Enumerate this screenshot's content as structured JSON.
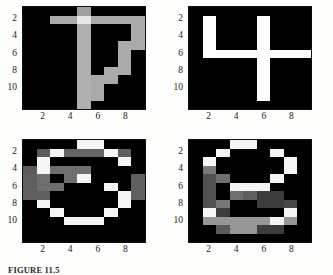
{
  "figure": {
    "caption": "FIGURE 11.5",
    "background_color": "#fdfdfb",
    "tick_color": "#1a1a1a",
    "panel_border_color": "#111111"
  },
  "axes": {
    "xticks": [
      "2",
      "4",
      "6",
      "8"
    ],
    "yticks": [
      "2",
      "4",
      "6",
      "8",
      "10"
    ],
    "xtick_values": [
      2,
      4,
      6,
      8
    ],
    "ytick_values": [
      2,
      4,
      6,
      8,
      10
    ]
  },
  "chart_data": {
    "type": "heatmap",
    "title": "FIGURE 11.5",
    "colormap": "gray",
    "vmin": 0,
    "vmax": 255,
    "grid": false,
    "legend": "none",
    "xlabel": "",
    "ylabel": "",
    "xlim": [
      0.5,
      9.5
    ],
    "ylim": [
      12.5,
      0.5
    ],
    "xticks": [
      2,
      4,
      6,
      8
    ],
    "yticks": [
      2,
      4,
      6,
      8,
      10
    ],
    "panel_cols": 9,
    "panel_rows": 12,
    "panels": [
      {
        "name": "digit-7",
        "position": "top-left",
        "label": "7",
        "values": [
          [
            0,
            0,
            0,
            0,
            160,
            0,
            0,
            0,
            0
          ],
          [
            0,
            0,
            170,
            170,
            230,
            170,
            170,
            170,
            170
          ],
          [
            0,
            0,
            0,
            0,
            175,
            0,
            0,
            0,
            170
          ],
          [
            0,
            0,
            0,
            0,
            175,
            0,
            0,
            0,
            170
          ],
          [
            0,
            0,
            0,
            0,
            175,
            0,
            0,
            170,
            170
          ],
          [
            0,
            0,
            0,
            0,
            175,
            0,
            0,
            170,
            0
          ],
          [
            0,
            0,
            0,
            0,
            175,
            0,
            0,
            170,
            0
          ],
          [
            0,
            0,
            0,
            0,
            175,
            0,
            170,
            170,
            0
          ],
          [
            0,
            0,
            0,
            0,
            175,
            170,
            170,
            0,
            0
          ],
          [
            0,
            0,
            0,
            0,
            175,
            170,
            0,
            0,
            0
          ],
          [
            0,
            0,
            0,
            0,
            175,
            170,
            0,
            0,
            0
          ],
          [
            0,
            0,
            0,
            0,
            175,
            0,
            0,
            0,
            0
          ]
        ]
      },
      {
        "name": "digit-4",
        "position": "top-right",
        "label": "4",
        "values": [
          [
            0,
            0,
            0,
            0,
            0,
            0,
            0,
            0,
            0
          ],
          [
            0,
            255,
            0,
            0,
            0,
            255,
            0,
            0,
            0
          ],
          [
            0,
            255,
            0,
            0,
            0,
            255,
            0,
            0,
            0
          ],
          [
            0,
            255,
            0,
            0,
            0,
            255,
            0,
            0,
            0
          ],
          [
            0,
            255,
            0,
            0,
            0,
            255,
            0,
            0,
            0
          ],
          [
            0,
            255,
            255,
            255,
            255,
            255,
            255,
            255,
            255
          ],
          [
            0,
            0,
            0,
            0,
            0,
            255,
            0,
            0,
            0
          ],
          [
            0,
            0,
            0,
            0,
            0,
            255,
            0,
            0,
            0
          ],
          [
            0,
            0,
            0,
            0,
            0,
            255,
            0,
            0,
            0
          ],
          [
            0,
            0,
            0,
            0,
            0,
            255,
            0,
            0,
            0
          ],
          [
            0,
            0,
            0,
            0,
            0,
            255,
            0,
            0,
            0
          ],
          [
            0,
            0,
            0,
            0,
            0,
            0,
            0,
            0,
            0
          ]
        ]
      },
      {
        "name": "digit-3",
        "position": "bottom-left",
        "label": "3",
        "values": [
          [
            0,
            0,
            0,
            0,
            245,
            245,
            0,
            0,
            0
          ],
          [
            0,
            90,
            245,
            100,
            100,
            100,
            245,
            95,
            0
          ],
          [
            0,
            245,
            0,
            0,
            0,
            0,
            0,
            245,
            0
          ],
          [
            90,
            245,
            110,
            110,
            110,
            0,
            0,
            0,
            0
          ],
          [
            95,
            110,
            0,
            110,
            245,
            0,
            0,
            0,
            95
          ],
          [
            95,
            110,
            110,
            0,
            0,
            0,
            245,
            0,
            95
          ],
          [
            95,
            95,
            0,
            0,
            0,
            0,
            0,
            245,
            95
          ],
          [
            0,
            245,
            0,
            0,
            0,
            0,
            0,
            245,
            0
          ],
          [
            0,
            0,
            245,
            0,
            0,
            0,
            245,
            0,
            0
          ],
          [
            0,
            0,
            0,
            245,
            245,
            245,
            0,
            0,
            0
          ],
          [
            0,
            0,
            0,
            0,
            0,
            0,
            0,
            0,
            0
          ],
          [
            0,
            0,
            0,
            0,
            0,
            0,
            0,
            0,
            0
          ]
        ]
      },
      {
        "name": "digit-8",
        "position": "bottom-right",
        "label": "8",
        "values": [
          [
            0,
            0,
            0,
            245,
            245,
            0,
            0,
            0,
            0
          ],
          [
            0,
            0,
            245,
            0,
            0,
            0,
            245,
            0,
            0
          ],
          [
            0,
            245,
            0,
            0,
            0,
            0,
            0,
            245,
            0
          ],
          [
            0,
            120,
            0,
            0,
            0,
            0,
            0,
            245,
            0
          ],
          [
            0,
            80,
            110,
            0,
            0,
            0,
            245,
            0,
            0
          ],
          [
            0,
            80,
            0,
            245,
            245,
            245,
            0,
            0,
            0
          ],
          [
            0,
            80,
            0,
            110,
            95,
            60,
            60,
            0,
            0
          ],
          [
            0,
            80,
            120,
            0,
            0,
            60,
            60,
            70,
            0
          ],
          [
            0,
            245,
            60,
            0,
            0,
            0,
            0,
            245,
            0
          ],
          [
            0,
            150,
            150,
            150,
            150,
            150,
            245,
            150,
            0
          ],
          [
            0,
            0,
            90,
            150,
            150,
            60,
            60,
            0,
            0
          ],
          [
            0,
            0,
            0,
            0,
            0,
            0,
            0,
            0,
            0
          ]
        ]
      }
    ]
  }
}
